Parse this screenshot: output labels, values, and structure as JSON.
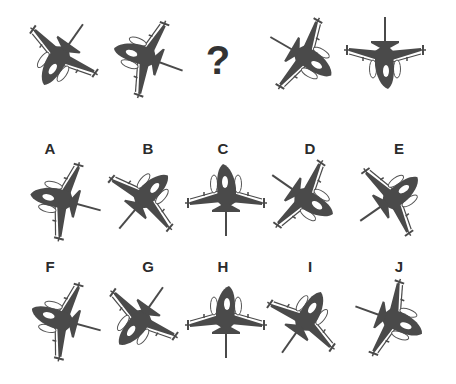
{
  "puzzle": {
    "question_mark": "?",
    "jet_color": "#4a4a4a",
    "outline_color": "#555555",
    "background": "#ffffff",
    "sequence": [
      {
        "id": "s1",
        "rotation": 215,
        "mirror": false,
        "x": 60,
        "y": 57
      },
      {
        "id": "s2",
        "rotation": 290,
        "mirror": false,
        "x": 145,
        "y": 57
      },
      {
        "id": "s3",
        "missing": true,
        "x": 220,
        "y": 57
      },
      {
        "id": "s4",
        "rotation": 120,
        "mirror": true,
        "x": 305,
        "y": 57
      },
      {
        "id": "s5",
        "rotation": 180,
        "mirror": false,
        "x": 385,
        "y": 57
      }
    ],
    "options": [
      {
        "label": "A",
        "rotation": 285,
        "mirror": false,
        "x": 62,
        "y": 200,
        "lx": 50,
        "ly": 141
      },
      {
        "label": "B",
        "rotation": 40,
        "mirror": true,
        "x": 145,
        "y": 198,
        "lx": 148,
        "ly": 141
      },
      {
        "label": "C",
        "rotation": 0,
        "mirror": false,
        "x": 226,
        "y": 196,
        "lx": 223,
        "ly": 141
      },
      {
        "label": "D",
        "rotation": 125,
        "mirror": false,
        "x": 305,
        "y": 198,
        "lx": 310,
        "ly": 141
      },
      {
        "label": "E",
        "rotation": 55,
        "mirror": false,
        "x": 393,
        "y": 198,
        "lx": 399,
        "ly": 141
      },
      {
        "label": "F",
        "rotation": 285,
        "mirror": true,
        "x": 62,
        "y": 320,
        "lx": 50,
        "ly": 259
      },
      {
        "label": "G",
        "rotation": 215,
        "mirror": true,
        "x": 140,
        "y": 320,
        "lx": 148,
        "ly": 259
      },
      {
        "label": "H",
        "rotation": 0,
        "mirror": true,
        "x": 226,
        "y": 318,
        "lx": 223,
        "ly": 259
      },
      {
        "label": "I",
        "rotation": 35,
        "mirror": false,
        "x": 305,
        "y": 320,
        "lx": 310,
        "ly": 259
      },
      {
        "label": "J",
        "rotation": 110,
        "mirror": true,
        "x": 393,
        "y": 320,
        "lx": 399,
        "ly": 259
      }
    ]
  }
}
